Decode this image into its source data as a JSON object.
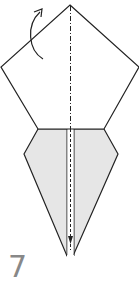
{
  "diagram": {
    "type": "origami-fold-step",
    "step_number": "7",
    "colors": {
      "line": "#222222",
      "paper_back": "#e6e6e6",
      "paper_front": "#ffffff",
      "step_number": "#888888"
    },
    "elements": [
      {
        "name": "pentagon-flap",
        "description": "upper pentagon flap, white side"
      },
      {
        "name": "kite-body",
        "description": "lower grey kite-shaped body"
      },
      {
        "name": "valley-fold-line",
        "description": "dash-dot vertical center fold line"
      },
      {
        "name": "fold-arrow",
        "description": "curved arrow indicating flap fold behind"
      }
    ]
  }
}
